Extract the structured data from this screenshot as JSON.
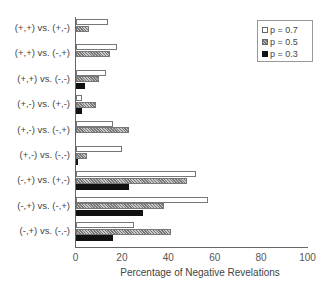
{
  "chart_data": {
    "type": "bar",
    "orientation": "horizontal",
    "title": "",
    "xlabel": "Percentage of Negative Revelations",
    "ylabel": "",
    "xlim": [
      0,
      100
    ],
    "xticks": [
      0,
      20,
      40,
      60,
      80,
      100
    ],
    "grid": false,
    "legend_position": "upper right",
    "categories": [
      "(+,+) vs. (+,-)",
      "(+,+) vs. (-,+)",
      "(+,+) vs. (-,-)",
      "(+,-) vs. (+,-)",
      "(+,-) vs. (-,+)",
      "(+,-) vs. (-,-)",
      "(-,+) vs. (+,-)",
      "(-,+) vs. (-,+)",
      "(-,+) vs. (-,-)"
    ],
    "series": [
      {
        "name": "p = 0.7",
        "style": "white",
        "values": [
          14,
          18,
          13,
          3,
          16,
          20,
          52,
          57,
          25
        ]
      },
      {
        "name": "p = 0.5",
        "style": "hatched",
        "values": [
          6,
          15,
          10,
          9,
          23,
          5,
          48,
          38,
          41
        ]
      },
      {
        "name": "p = 0.3",
        "style": "black",
        "values": [
          0,
          0,
          4,
          3,
          0,
          1,
          23,
          29,
          16
        ]
      }
    ]
  }
}
